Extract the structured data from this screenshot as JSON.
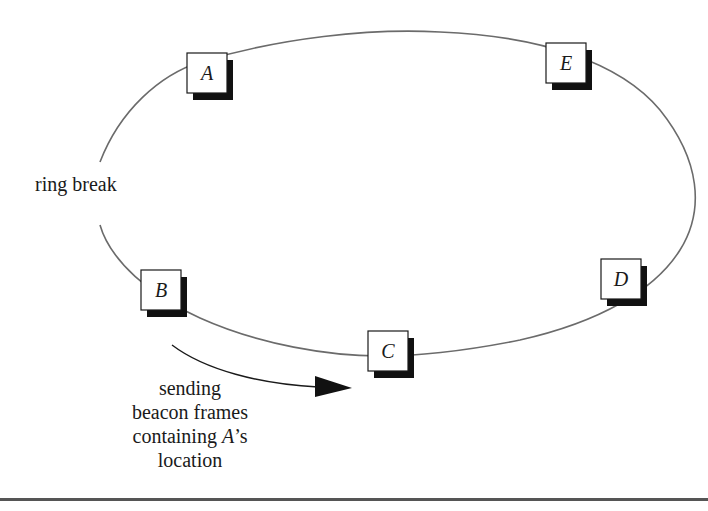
{
  "diagram": {
    "type": "token-ring",
    "colors": {
      "ring": "#6b6b6b",
      "node_border": "#1a1a1a",
      "node_fill": "#ffffff",
      "node_shadow": "#111111",
      "text": "#1a1a1a",
      "arrow": "#111111",
      "rule": "#555555"
    },
    "ring": {
      "cx": 400,
      "cy": 192,
      "rx": 304,
      "ry": 164
    },
    "nodes": [
      {
        "id": "A",
        "label": "A",
        "x": 187,
        "y": 53,
        "w": 40,
        "h": 40
      },
      {
        "id": "E",
        "label": "E",
        "x": 546,
        "y": 43,
        "w": 40,
        "h": 40
      },
      {
        "id": "B",
        "label": "B",
        "x": 141,
        "y": 270,
        "w": 40,
        "h": 40
      },
      {
        "id": "C",
        "label": "C",
        "x": 368,
        "y": 331,
        "w": 40,
        "h": 40
      },
      {
        "id": "D",
        "label": "D",
        "x": 601,
        "y": 259,
        "w": 40,
        "h": 40
      }
    ],
    "labels": {
      "ring_break": "ring break",
      "beacon_line1": "sending",
      "beacon_line2": "beacon frames",
      "beacon_line3_italic": "A",
      "beacon_line3_rest": "’s",
      "beacon_line3_prefix": "containing ",
      "beacon_line4": "location"
    },
    "arrow": {
      "from_node": "B",
      "to_node": "C",
      "meaning": "beacon frames direction"
    }
  }
}
